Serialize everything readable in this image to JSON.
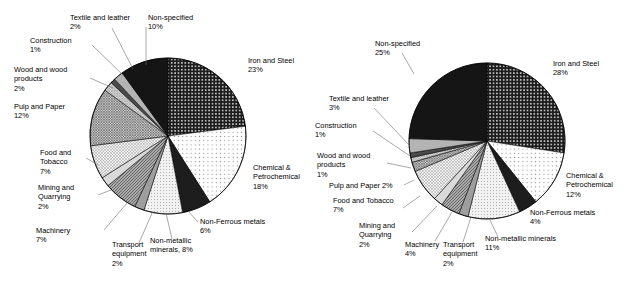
{
  "figure": {
    "background": "#ffffff",
    "label_color": "#000000",
    "outline_color": "#000000",
    "leader_color": "#6e6e6e"
  },
  "chart_data": [
    {
      "type": "pie",
      "name": "left-pie-chart",
      "title": "",
      "start_angle_deg": 0,
      "direction": "clockwise",
      "legend": "labels-outside-with-leader-lines",
      "center": {
        "x": 168,
        "y": 136
      },
      "radius": 78,
      "categories": [
        "Iron and Steel",
        "Chemical & Petrochemical",
        "Non-Ferrous metals",
        "Non-metallic minerals",
        "Transport equipment",
        "Machinery",
        "Mining and Quarrying",
        "Food and Tobacco",
        "Pulp and Paper",
        "Wood and wood products",
        "Construction",
        "Textile and leather",
        "Non-specified"
      ],
      "values": [
        23,
        18,
        6,
        8,
        2,
        7,
        2,
        7,
        12,
        2,
        1,
        2,
        10
      ],
      "slices": [
        {
          "label": "Iron and Steel",
          "value": 23,
          "value_text": "23%",
          "label_lines": [
            "Iron and Steel",
            "23%"
          ],
          "fill": "#1a1a1a",
          "pattern": "dots-light-on-dark",
          "label_x": 248,
          "label_y": 63,
          "anchor": "start",
          "leader": false
        },
        {
          "label": "Chemical & Petrochemical",
          "value": 18,
          "value_text": "18%",
          "label_lines": [
            "Chemical &",
            "Petrochemical",
            "18%"
          ],
          "fill": "#fbfbfb",
          "pattern": "dots-sparse",
          "label_x": 253,
          "label_y": 170,
          "anchor": "start",
          "leader": false
        },
        {
          "label": "Non-Ferrous metals",
          "value": 6,
          "value_text": "6%",
          "label_lines": [
            "Non-Ferrous metals",
            "6%"
          ],
          "fill": "#1a1a1a",
          "pattern": "solid-dark",
          "label_x": 200,
          "label_y": 224,
          "anchor": "start",
          "leader": true,
          "lx1": 198,
          "ly1": 222,
          "lx2": 188,
          "ly2": 211
        },
        {
          "label": "Non-metallic minerals",
          "value": 8,
          "value_text": "8%",
          "label_lines": [
            "Non-metallic",
            "minerals, 8%"
          ],
          "fill": "#efefef",
          "pattern": "dots-fine",
          "label_x": 150,
          "label_y": 243,
          "anchor": "start",
          "leader": true,
          "lx1": 172,
          "ly1": 239,
          "lx2": 166,
          "ly2": 213
        },
        {
          "label": "Transport equipment",
          "value": 2,
          "value_text": "2%",
          "label_lines": [
            "Transport",
            "equipment",
            "2%"
          ],
          "fill": "#9e9e9e",
          "pattern": "solid-mid",
          "label_x": 112,
          "label_y": 247,
          "anchor": "start",
          "leader": true,
          "lx1": 139,
          "ly1": 243,
          "lx2": 153,
          "ly2": 211
        },
        {
          "label": "Machinery",
          "value": 7,
          "value_text": "7%",
          "label_lines": [
            "Machinery",
            "7%"
          ],
          "fill": "#8c8c8c",
          "pattern": "hatch-mid",
          "label_x": 36,
          "label_y": 233,
          "anchor": "start",
          "leader": true,
          "lx1": 104,
          "ly1": 230,
          "lx2": 127,
          "ly2": 203
        },
        {
          "label": "Mining and Quarrying",
          "value": 2,
          "value_text": "2%",
          "label_lines": [
            "Mining and",
            "Quarrying",
            "2%"
          ],
          "fill": "#d8d8d8",
          "pattern": "solid-light",
          "label_x": 38,
          "label_y": 190,
          "anchor": "start",
          "leader": true,
          "lx1": 98,
          "ly1": 195,
          "lx2": 111,
          "ly2": 190
        },
        {
          "label": "Food and Tobacco",
          "value": 7,
          "value_text": "7%",
          "label_lines": [
            "Food and",
            "Tobacco",
            "7%"
          ],
          "fill": "#e3e3e3",
          "pattern": "crosshatch-light",
          "label_x": 40,
          "label_y": 155,
          "anchor": "start",
          "leader": true,
          "lx1": 86,
          "ly1": 158,
          "lx2": 98,
          "ly2": 165
        },
        {
          "label": "Pulp and Paper",
          "value": 12,
          "value_text": "12%",
          "label_lines": [
            "Pulp and Paper",
            "12%"
          ],
          "fill": "#b5b5b5",
          "pattern": "crosshatch-mid",
          "label_x": 14,
          "label_y": 109,
          "anchor": "start",
          "leader": false
        },
        {
          "label": "Wood and wood products",
          "value": 2,
          "value_text": "2%",
          "label_lines": [
            "Wood and wood",
            "products",
            "2%"
          ],
          "fill": "#cfcfcf",
          "pattern": "crosshatch-fine",
          "label_x": 14,
          "label_y": 72,
          "anchor": "start",
          "leader": true,
          "lx1": 90,
          "ly1": 78,
          "lx2": 113,
          "ly2": 88
        },
        {
          "label": "Construction",
          "value": 1,
          "value_text": "1%",
          "label_lines": [
            "Construction",
            "1%"
          ],
          "fill": "#4a4a4a",
          "pattern": "solid-darkgray",
          "label_x": 30,
          "label_y": 43,
          "anchor": "start",
          "leader": true,
          "lx1": 92,
          "ly1": 45,
          "lx2": 124,
          "ly2": 76
        },
        {
          "label": "Textile and leather",
          "value": 2,
          "value_text": "2%",
          "label_lines": [
            "Textile and leather",
            "2%"
          ],
          "fill": "#b0b0b0",
          "pattern": "solid-mid-light",
          "label_x": 70,
          "label_y": 20,
          "anchor": "start",
          "leader": true,
          "lx1": 112,
          "ly1": 28,
          "lx2": 133,
          "ly2": 69
        },
        {
          "label": "Non-specified",
          "value": 10,
          "value_text": "10%",
          "label_lines": [
            "Non-specified",
            "10%"
          ],
          "fill": "#161616",
          "pattern": "solid-black",
          "label_x": 148,
          "label_y": 20,
          "anchor": "start",
          "leader": true,
          "lx1": 146,
          "ly1": 27,
          "lx2": 146,
          "ly2": 65
        }
      ]
    },
    {
      "type": "pie",
      "name": "right-pie-chart",
      "title": "",
      "start_angle_deg": 0,
      "direction": "clockwise",
      "legend": "labels-outside-with-leader-lines",
      "center": {
        "x": 172,
        "y": 141
      },
      "radius": 78,
      "categories": [
        "Iron and Steel",
        "Chemical & Petrochemical",
        "Non-Ferrous metals",
        "Non-metallic minerals",
        "Transport equipment",
        "Machinery",
        "Mining and Quarrying",
        "Food and Tobacco",
        "Pulp and Paper",
        "Wood and wood products",
        "Construction",
        "Textile and leather",
        "Non-specified"
      ],
      "values": [
        28,
        12,
        4,
        11,
        2,
        4,
        2,
        7,
        2,
        1,
        1,
        3,
        25
      ],
      "slices": [
        {
          "label": "Iron and Steel",
          "value": 28,
          "value_text": "28%",
          "label_lines": [
            "Iron and Steel",
            "28%"
          ],
          "fill": "#1a1a1a",
          "pattern": "dots-light-on-dark",
          "label_x": 238,
          "label_y": 66,
          "anchor": "start",
          "leader": false
        },
        {
          "label": "Chemical & Petrochemical",
          "value": 12,
          "value_text": "12%",
          "label_lines": [
            "Chemical &",
            "Petrochemical",
            "12%"
          ],
          "fill": "#fbfbfb",
          "pattern": "dots-sparse",
          "label_x": 251,
          "label_y": 178,
          "anchor": "start",
          "leader": false
        },
        {
          "label": "Non-Ferrous metals",
          "value": 4,
          "value_text": "4%",
          "label_lines": [
            "Non-Ferrous metals",
            "4%"
          ],
          "fill": "#1a1a1a",
          "pattern": "solid-dark",
          "label_x": 215,
          "label_y": 215,
          "anchor": "start",
          "leader": false
        },
        {
          "label": "Non-metallic minerals",
          "value": 11,
          "value_text": "11%",
          "label_lines": [
            "Non-metallic minerals",
            "11%"
          ],
          "fill": "#efefef",
          "pattern": "dots-fine",
          "label_x": 170,
          "label_y": 241,
          "anchor": "start",
          "leader": true,
          "lx1": 183,
          "ly1": 237,
          "lx2": 175,
          "ly2": 220
        },
        {
          "label": "Transport equipment",
          "value": 2,
          "value_text": "2%",
          "label_lines": [
            "Transport",
            "equipment",
            "2%"
          ],
          "fill": "#9e9e9e",
          "pattern": "solid-mid",
          "label_x": 128,
          "label_y": 247,
          "anchor": "start",
          "leader": true,
          "lx1": 148,
          "ly1": 242,
          "lx2": 156,
          "ly2": 217
        },
        {
          "label": "Machinery",
          "value": 4,
          "value_text": "4%",
          "label_lines": [
            "Machinery",
            "4%"
          ],
          "fill": "#8c8c8c",
          "pattern": "hatch-mid",
          "label_x": 90,
          "label_y": 247,
          "anchor": "start",
          "leader": true,
          "lx1": 120,
          "ly1": 241,
          "lx2": 137,
          "ly2": 212
        },
        {
          "label": "Mining and Quarrying",
          "value": 2,
          "value_text": "2%",
          "label_lines": [
            "Mining and",
            "Quarrying",
            "2%"
          ],
          "fill": "#d8d8d8",
          "pattern": "solid-light",
          "label_x": 44,
          "label_y": 228,
          "anchor": "start",
          "leader": true,
          "lx1": 97,
          "ly1": 232,
          "lx2": 122,
          "ly2": 206
        },
        {
          "label": "Food and Tobacco",
          "value": 7,
          "value_text": "7%",
          "label_lines": [
            "Food and Tobacco",
            "7%"
          ],
          "fill": "#e3e3e3",
          "pattern": "crosshatch-light",
          "label_x": 18,
          "label_y": 203,
          "anchor": "start",
          "leader": true,
          "lx1": 88,
          "ly1": 208,
          "lx2": 105,
          "ly2": 196
        },
        {
          "label": "Pulp and Paper",
          "value": 2,
          "value_text": "2%",
          "label_lines": [
            "Pulp and Paper 2%"
          ],
          "fill": "#b5b5b5",
          "pattern": "crosshatch-mid",
          "label_x": 14,
          "label_y": 188,
          "anchor": "start",
          "leader": true,
          "lx1": 89,
          "ly1": 185,
          "lx2": 99,
          "ly2": 180
        },
        {
          "label": "Wood and wood products",
          "value": 1,
          "value_text": "1%",
          "label_lines": [
            "Wood and wood",
            "products",
            "1%"
          ],
          "fill": "#cfcfcf",
          "pattern": "crosshatch-fine",
          "label_x": 2,
          "label_y": 158,
          "anchor": "start",
          "leader": true,
          "lx1": 72,
          "ly1": 163,
          "lx2": 96,
          "ly2": 168
        },
        {
          "label": "Construction",
          "value": 1,
          "value_text": "1%",
          "label_lines": [
            "Construction",
            "1%"
          ],
          "fill": "#4a4a4a",
          "pattern": "solid-darkgray",
          "label_x": 0,
          "label_y": 128,
          "anchor": "start",
          "leader": true,
          "lx1": 58,
          "ly1": 131,
          "lx2": 95,
          "ly2": 156
        },
        {
          "label": "Textile and leather",
          "value": 3,
          "value_text": "3%",
          "label_lines": [
            "Textile and leather",
            "3%"
          ],
          "fill": "#b0b0b0",
          "pattern": "solid-mid-light",
          "label_x": 14,
          "label_y": 101,
          "anchor": "start",
          "leader": true,
          "lx1": 59,
          "ly1": 108,
          "lx2": 95,
          "ly2": 146
        },
        {
          "label": "Non-specified",
          "value": 25,
          "value_text": "25%",
          "label_lines": [
            "Non-specified",
            "25%"
          ],
          "fill": "#161616",
          "pattern": "solid-black",
          "label_x": 60,
          "label_y": 46,
          "anchor": "start",
          "leader": true,
          "lx1": 87,
          "ly1": 53,
          "lx2": 99,
          "ly2": 74
        }
      ]
    }
  ]
}
